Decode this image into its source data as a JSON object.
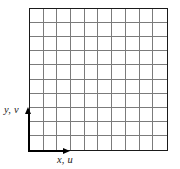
{
  "figure": {
    "type": "mesh-grid-diagram"
  },
  "grid": {
    "columns": 10,
    "rows": 10,
    "line_color": "#7b7b7b",
    "border_color": "#1a1a1a",
    "fill_color": "#ffffff"
  },
  "axes": {
    "color": "#000000",
    "y_axis": {
      "name": "vertical-axis",
      "label": "y, v",
      "direction": "up"
    },
    "x_axis": {
      "name": "horizontal-axis",
      "label": "x, u",
      "direction": "right"
    }
  }
}
